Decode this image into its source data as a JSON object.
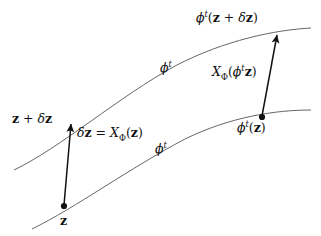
{
  "figure": {
    "background_color": "#ffffff",
    "stroke_color": "#555555",
    "arrow_color": "#111111",
    "text_color": "#111111",
    "width": 321,
    "height": 236
  },
  "curves": [
    {
      "name": "upper-trajectory",
      "label": "phi^t",
      "path": "M 14 170 C 60 148, 120 96, 175 66 C 225 40, 275 30, 311 28"
    },
    {
      "name": "lower-trajectory",
      "label": "phi^t",
      "path": "M 32 229 C 75 208, 130 168, 185 139 C 230 117, 275 110, 311 110"
    }
  ],
  "points": [
    {
      "name": "point-z",
      "x": 64,
      "y": 206,
      "label": "z"
    },
    {
      "name": "point-phit-z",
      "x": 262,
      "y": 117,
      "label": "phi^t(z)"
    }
  ],
  "arrows": [
    {
      "name": "arrow-delta-z",
      "from_x": 64,
      "from_y": 205,
      "to_x": 71,
      "to_y": 122,
      "label": "delta z = X_Phi(z)"
    },
    {
      "name": "arrow-vector-field",
      "from_x": 262,
      "from_y": 116,
      "to_x": 277,
      "to_y": 33,
      "label": "X_Phi(phi^t z)"
    }
  ],
  "labels": {
    "top_right": {
      "id": "phi-t-of-z-plus-delta-z",
      "phi": "ϕ",
      "sup": "t",
      "open": "(",
      "z1": "z",
      "plus": " + ",
      "delta": "δ",
      "z2": "z",
      "close": ")"
    },
    "vector_field_right": {
      "id": "X-Phi-of-phi-t-z",
      "X": "X",
      "sub": "Φ",
      "open": "(",
      "phi": "ϕ",
      "sup": "t",
      "z": "z",
      "close": ")"
    },
    "phi_t_of_z": {
      "id": "phi-t-of-z",
      "phi": "ϕ",
      "sup": "t",
      "open": "(",
      "z": "z",
      "close": ")"
    },
    "z_plus_delta_z": {
      "id": "z-plus-delta-z",
      "z1": "z",
      "plus": " + ",
      "delta": "δ",
      "z2": "z"
    },
    "delta_z_equation": {
      "id": "delta-z-equals-X-Phi-of-z",
      "delta": "δ",
      "z1": "z",
      "equals": " = ",
      "X": "X",
      "sub": "Φ",
      "open": "(",
      "z2": "z",
      "close": ")"
    },
    "z_bottom": {
      "id": "z-origin",
      "z": "z"
    },
    "phi_t_upper_curve": {
      "id": "phi-t-upper",
      "phi": "ϕ",
      "sup": "t"
    },
    "phi_t_lower_curve": {
      "id": "phi-t-lower",
      "phi": "ϕ",
      "sup": "t"
    }
  }
}
